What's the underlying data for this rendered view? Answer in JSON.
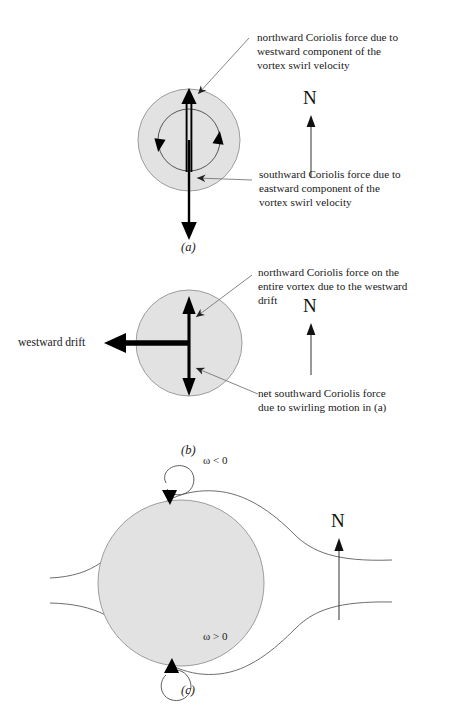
{
  "figure": {
    "background_color": "#ffffff",
    "disk_fill_color": "#e2e2e2",
    "disk_stroke_color": "#9a9a9a",
    "arrow_color": "#000000",
    "leader_color": "#7a7a7a",
    "flowline_color": "#6e6e6e"
  },
  "panels": [
    {
      "id": "panel-a",
      "label": "(a)",
      "compass": {
        "letter": "N",
        "icon": "north-arrow-icon"
      },
      "annotations": [
        {
          "id": "annotation-northward-swirl",
          "text": "northward Coriolis force due to\nwestward component of the\nvortex swirl velocity"
        },
        {
          "id": "annotation-southward-swirl",
          "text": "southward Coriolis force due to\neastward component of the\nvortex swirl velocity"
        }
      ],
      "elements": [
        {
          "name": "vortex-disk",
          "type": "shaded-circle"
        },
        {
          "name": "swirl-circle",
          "type": "circulation-ring"
        },
        {
          "name": "northward-force-arrow",
          "type": "double-line-arrow-up"
        },
        {
          "name": "southward-force-arrow",
          "type": "arrow-down"
        },
        {
          "name": "swirl-arrowhead-left",
          "type": "arrowhead-up"
        },
        {
          "name": "swirl-arrowhead-right",
          "type": "arrowhead-down"
        }
      ]
    },
    {
      "id": "panel-b",
      "label": "(b)",
      "compass": {
        "letter": "N",
        "icon": "north-arrow-icon"
      },
      "drift_label": "westward drift",
      "annotations": [
        {
          "id": "annotation-northward-drift",
          "text": "northward Coriolis force on the\nentire vortex due to the westward\ndrift"
        },
        {
          "id": "annotation-net-southward",
          "text": "net southward Coriolis force\ndue to swirling motion in (a)"
        }
      ],
      "elements": [
        {
          "name": "vortex-disk",
          "type": "shaded-circle"
        },
        {
          "name": "westward-drift-arrow",
          "type": "thick-arrow-left"
        },
        {
          "name": "vertical-force-arrow",
          "type": "double-headed-arrow-vertical"
        }
      ]
    },
    {
      "id": "panel-c",
      "label": "(c)",
      "compass": {
        "letter": "N",
        "icon": "north-arrow-icon"
      },
      "annotations": [
        {
          "id": "omega-negative",
          "text": "ω < 0",
          "symbol": "ω",
          "relation": "<",
          "value": "0"
        },
        {
          "id": "omega-positive",
          "text": "ω > 0",
          "symbol": "ω",
          "relation": ">",
          "value": "0"
        }
      ],
      "elements": [
        {
          "name": "vortex-disk",
          "type": "shaded-circle"
        },
        {
          "name": "streamline-upper",
          "type": "flow-line"
        },
        {
          "name": "streamline-lower",
          "type": "flow-line"
        },
        {
          "name": "vorticity-curl-top",
          "type": "curl-arrow-clockwise"
        },
        {
          "name": "vorticity-curl-bottom",
          "type": "curl-arrow-counterclockwise"
        }
      ]
    }
  ]
}
